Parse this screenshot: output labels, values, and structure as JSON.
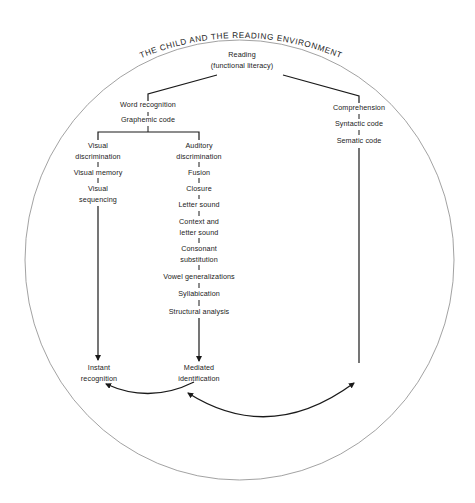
{
  "title": "THE CHILD AND THE READING ENVIRONMENT",
  "root": {
    "line1": "Reading",
    "line2": "(functional literacy)"
  },
  "word_recognition": {
    "label": "Word recognition",
    "code": "Graphemic code"
  },
  "visual_branch": {
    "items": [
      "Visual",
      "discrimination",
      "Visual memory",
      "Visual",
      "sequencing"
    ],
    "nodes": [
      "Visual discrimination",
      "Visual memory",
      "Visual sequencing"
    ],
    "outcome_line1": "Instant",
    "outcome_line2": "recognition"
  },
  "auditory_branch": {
    "nodes": [
      "Auditory discrimination",
      "Fusion",
      "Closure",
      "Letter sound",
      "Context and letter sound",
      "Consonant substitution",
      "Vowel generalizations",
      "Syllabication",
      "Structural analysis"
    ],
    "lines": {
      "auditory1": "Auditory",
      "auditory2": "discrimination",
      "fusion": "Fusion",
      "closure": "Closure",
      "letter_sound": "Letter sound",
      "context1": "Context and",
      "context2": "letter sound",
      "consonant1": "Consonant",
      "consonant2": "substitution",
      "vowel": "Vowel generalizations",
      "syllabication": "Syllabication",
      "structural": "Structural analysis"
    },
    "outcome_line1": "Mediated",
    "outcome_line2": "identification"
  },
  "comprehension_branch": {
    "label": "Comprehension",
    "items": [
      "Syntactic code",
      "Sematic code"
    ]
  },
  "colors": {
    "line": "#1a1a1a",
    "circle": "#7a7a7a",
    "text": "#222222"
  }
}
